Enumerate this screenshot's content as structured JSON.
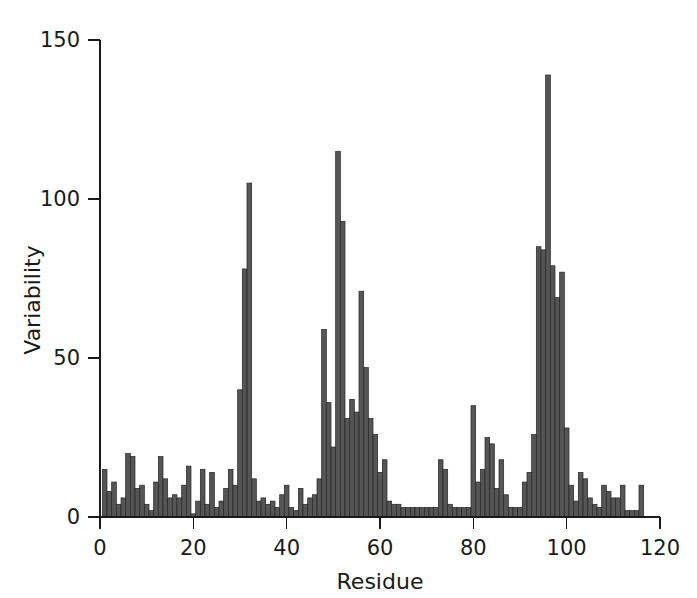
{
  "chart_data": {
    "type": "bar",
    "title": "",
    "subtitle": "",
    "xlabel": "Residue",
    "ylabel": "Variability",
    "xlim": [
      0,
      120
    ],
    "ylim": [
      0,
      150
    ],
    "xticks": [
      0,
      20,
      40,
      60,
      80,
      100,
      120
    ],
    "yticks": [
      0,
      50,
      100,
      150
    ],
    "xtick_labels": [
      "0",
      "20",
      "40",
      "60",
      "80",
      "100",
      "120"
    ],
    "ytick_labels": [
      "0",
      "50",
      "100",
      "150"
    ],
    "grid": false,
    "legend": null,
    "bar_color": "#555555",
    "bar_edge_color": "#262626",
    "axis_color": "#1a1a1a",
    "background": "#ffffff",
    "categories": [
      1,
      2,
      3,
      4,
      5,
      6,
      7,
      8,
      9,
      10,
      11,
      12,
      13,
      14,
      15,
      16,
      17,
      18,
      19,
      20,
      21,
      22,
      23,
      24,
      25,
      26,
      27,
      28,
      29,
      30,
      31,
      32,
      33,
      34,
      35,
      36,
      37,
      38,
      39,
      40,
      41,
      42,
      43,
      44,
      45,
      46,
      47,
      48,
      49,
      50,
      51,
      52,
      53,
      54,
      55,
      56,
      57,
      58,
      59,
      60,
      61,
      62,
      63,
      64,
      65,
      66,
      67,
      68,
      69,
      70,
      71,
      72,
      73,
      74,
      75,
      76,
      77,
      78,
      79,
      80,
      81,
      82,
      83,
      84,
      85,
      86,
      87,
      88,
      89,
      90,
      91,
      92,
      93,
      94,
      95,
      96,
      97,
      98,
      99,
      100,
      101,
      102,
      103,
      104,
      105,
      106,
      107,
      108,
      109,
      110,
      111,
      112,
      113,
      114,
      115,
      116
    ],
    "values": [
      15,
      8,
      11,
      4,
      6,
      20,
      19,
      9,
      10,
      4,
      2,
      11,
      19,
      12,
      6,
      7,
      6,
      10,
      16,
      1,
      5,
      15,
      4,
      14,
      3,
      5,
      9,
      15,
      10,
      40,
      78,
      105,
      12,
      5,
      6,
      4,
      5,
      3,
      7,
      10,
      3,
      2,
      9,
      4,
      6,
      7,
      12,
      59,
      36,
      22,
      115,
      93,
      31,
      37,
      33,
      71,
      47,
      31,
      26,
      14,
      18,
      5,
      4,
      4,
      3,
      3,
      3,
      3,
      3,
      3,
      3,
      3,
      18,
      15,
      4,
      3,
      3,
      3,
      3,
      35,
      11,
      15,
      25,
      23,
      9,
      18,
      7,
      3,
      3,
      3,
      11,
      14,
      26,
      85,
      84,
      139,
      79,
      69,
      77,
      28,
      10,
      5,
      14,
      12,
      6,
      4,
      3,
      10,
      8,
      6,
      6,
      10,
      2,
      2,
      2,
      10
    ],
    "series_name": "Variability"
  },
  "axes": {
    "y_label": "Variability",
    "x_label": "Residue"
  }
}
